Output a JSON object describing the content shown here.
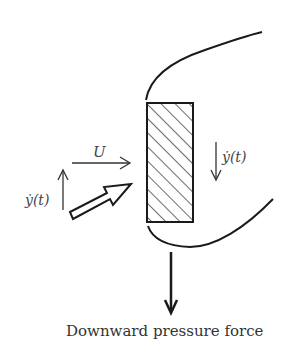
{
  "diagram": {
    "type": "physical-schematic",
    "colors": {
      "stroke": "#1a1a1a",
      "text": "#444444",
      "background": "#ffffff"
    },
    "body": {
      "shape": "rectangle",
      "fill": "diagonal-hatch"
    },
    "labels": {
      "flow_velocity": "U",
      "left_velocity": "ẏ(t)",
      "right_velocity": "ẏ(t)",
      "caption": "Downward pressure force"
    },
    "arrows": [
      {
        "name": "free-stream",
        "direction": "right",
        "label": "U"
      },
      {
        "name": "body-velocity-left",
        "direction": "up",
        "label": "ẏ(t)"
      },
      {
        "name": "relative-flow",
        "direction": "up-right",
        "style": "hollow"
      },
      {
        "name": "body-velocity-right",
        "direction": "down",
        "label": "ẏ(t)"
      },
      {
        "name": "pressure-force",
        "direction": "down",
        "label": "Downward pressure force"
      }
    ]
  }
}
